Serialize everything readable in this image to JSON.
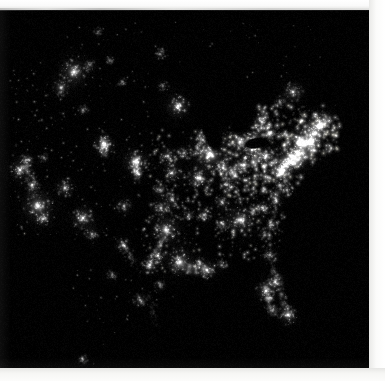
{
  "image": {
    "title": "Continental United States at Night",
    "subject": "city-lights-satellite-composite",
    "alt_text": "Satellite nighttime view of the continental United States showing city lights against black land and ocean",
    "frame": {
      "canvas_width": 385,
      "canvas_height": 381,
      "dark_area_x": 0,
      "dark_area_y": 10,
      "dark_area_width": 369,
      "dark_area_height": 358,
      "border_color": "#f7f7f5",
      "background_color": "#000000",
      "light_color": "#ffffff"
    }
  },
  "chart_data": {
    "type": "heatmap",
    "xlabel": "",
    "ylabel": "",
    "colormap": "black-to-white luminance",
    "grid": false,
    "legend": "none",
    "xlim": [
      0,
      369
    ],
    "ylim": [
      0,
      358
    ],
    "dark_voids": [
      {
        "name": "Lake Michigan",
        "x": 212,
        "y": 124,
        "rx": 9,
        "ry": 20,
        "angle": -18
      },
      {
        "name": "Lake Superior",
        "x": 208,
        "y": 100,
        "rx": 20,
        "ry": 8,
        "angle": -8
      },
      {
        "name": "Lake Huron",
        "x": 240,
        "y": 112,
        "rx": 10,
        "ry": 14,
        "angle": 12
      },
      {
        "name": "Lake Erie",
        "x": 256,
        "y": 133,
        "rx": 14,
        "ry": 6,
        "angle": -10
      },
      {
        "name": "Atlantic Ocean",
        "x": 350,
        "y": 250,
        "rx": 70,
        "ry": 110,
        "angle": 0
      },
      {
        "name": "Gulf of Mexico",
        "x": 215,
        "y": 350,
        "rx": 110,
        "ry": 60,
        "angle": 0
      }
    ],
    "metro_lights": [
      {
        "name": "Seattle-Tacoma",
        "x": 74,
        "y": 62,
        "intensity": 0.92,
        "radius": 9
      },
      {
        "name": "Portland",
        "x": 61,
        "y": 78,
        "intensity": 0.6,
        "radius": 6
      },
      {
        "name": "Spokane",
        "x": 90,
        "y": 55,
        "intensity": 0.42,
        "radius": 4
      },
      {
        "name": "Boise",
        "x": 83,
        "y": 100,
        "intensity": 0.4,
        "radius": 4
      },
      {
        "name": "Billings",
        "x": 122,
        "y": 72,
        "intensity": 0.38,
        "radius": 3
      },
      {
        "name": "Great Falls",
        "x": 110,
        "y": 50,
        "intensity": 0.36,
        "radius": 3
      },
      {
        "name": "Salt Lake City",
        "x": 104,
        "y": 135,
        "intensity": 0.85,
        "radius": 7
      },
      {
        "name": "Denver",
        "x": 136,
        "y": 152,
        "intensity": 0.88,
        "radius": 8
      },
      {
        "name": "Colorado Springs",
        "x": 137,
        "y": 163,
        "intensity": 0.5,
        "radius": 4
      },
      {
        "name": "Albuquerque",
        "x": 124,
        "y": 196,
        "intensity": 0.6,
        "radius": 5
      },
      {
        "name": "El Paso",
        "x": 123,
        "y": 235,
        "intensity": 0.58,
        "radius": 5
      },
      {
        "name": "Phoenix",
        "x": 83,
        "y": 208,
        "intensity": 0.82,
        "radius": 8
      },
      {
        "name": "Tucson",
        "x": 92,
        "y": 224,
        "intensity": 0.52,
        "radius": 5
      },
      {
        "name": "Las Vegas",
        "x": 65,
        "y": 178,
        "intensity": 0.7,
        "radius": 6
      },
      {
        "name": "Los Angeles",
        "x": 38,
        "y": 196,
        "intensity": 0.95,
        "radius": 10
      },
      {
        "name": "San Diego",
        "x": 43,
        "y": 209,
        "intensity": 0.62,
        "radius": 5
      },
      {
        "name": "San Francisco Bay",
        "x": 20,
        "y": 160,
        "intensity": 0.8,
        "radius": 7
      },
      {
        "name": "Sacramento",
        "x": 26,
        "y": 150,
        "intensity": 0.55,
        "radius": 5
      },
      {
        "name": "Fresno-Bakersfield",
        "x": 32,
        "y": 175,
        "intensity": 0.48,
        "radius": 5
      },
      {
        "name": "Reno",
        "x": 44,
        "y": 148,
        "intensity": 0.38,
        "radius": 4
      },
      {
        "name": "Minneapolis-St Paul",
        "x": 178,
        "y": 96,
        "intensity": 0.88,
        "radius": 8
      },
      {
        "name": "Fargo",
        "x": 163,
        "y": 76,
        "intensity": 0.4,
        "radius": 4
      },
      {
        "name": "Omaha",
        "x": 168,
        "y": 146,
        "intensity": 0.62,
        "radius": 6
      },
      {
        "name": "Des Moines",
        "x": 184,
        "y": 143,
        "intensity": 0.52,
        "radius": 5
      },
      {
        "name": "Kansas City",
        "x": 172,
        "y": 163,
        "intensity": 0.72,
        "radius": 6
      },
      {
        "name": "Wichita",
        "x": 160,
        "y": 180,
        "intensity": 0.52,
        "radius": 5
      },
      {
        "name": "Oklahoma City",
        "x": 161,
        "y": 198,
        "intensity": 0.62,
        "radius": 6
      },
      {
        "name": "Tulsa",
        "x": 172,
        "y": 190,
        "intensity": 0.55,
        "radius": 5
      },
      {
        "name": "Dallas-Fort Worth",
        "x": 166,
        "y": 220,
        "intensity": 0.93,
        "radius": 9
      },
      {
        "name": "Austin",
        "x": 158,
        "y": 246,
        "intensity": 0.55,
        "radius": 5
      },
      {
        "name": "San Antonio",
        "x": 150,
        "y": 255,
        "intensity": 0.7,
        "radius": 6
      },
      {
        "name": "Houston",
        "x": 180,
        "y": 252,
        "intensity": 0.9,
        "radius": 9
      },
      {
        "name": "New Orleans",
        "x": 207,
        "y": 260,
        "intensity": 0.7,
        "radius": 6
      },
      {
        "name": "Baton Rouge",
        "x": 200,
        "y": 253,
        "intensity": 0.48,
        "radius": 4
      },
      {
        "name": "Memphis",
        "x": 204,
        "y": 205,
        "intensity": 0.62,
        "radius": 5
      },
      {
        "name": "Little Rock",
        "x": 189,
        "y": 205,
        "intensity": 0.45,
        "radius": 4
      },
      {
        "name": "St Louis",
        "x": 198,
        "y": 168,
        "intensity": 0.78,
        "radius": 7
      },
      {
        "name": "Chicago",
        "x": 210,
        "y": 144,
        "intensity": 0.97,
        "radius": 11
      },
      {
        "name": "Milwaukee",
        "x": 203,
        "y": 130,
        "intensity": 0.6,
        "radius": 5
      },
      {
        "name": "Indianapolis",
        "x": 223,
        "y": 158,
        "intensity": 0.7,
        "radius": 6
      },
      {
        "name": "Detroit",
        "x": 240,
        "y": 132,
        "intensity": 0.85,
        "radius": 8
      },
      {
        "name": "Cleveland",
        "x": 252,
        "y": 140,
        "intensity": 0.75,
        "radius": 7
      },
      {
        "name": "Columbus",
        "x": 244,
        "y": 155,
        "intensity": 0.62,
        "radius": 6
      },
      {
        "name": "Cincinnati",
        "x": 235,
        "y": 166,
        "intensity": 0.62,
        "radius": 6
      },
      {
        "name": "Louisville",
        "x": 227,
        "y": 175,
        "intensity": 0.55,
        "radius": 5
      },
      {
        "name": "Nashville",
        "x": 222,
        "y": 192,
        "intensity": 0.62,
        "radius": 5
      },
      {
        "name": "Birmingham",
        "x": 223,
        "y": 214,
        "intensity": 0.55,
        "radius": 5
      },
      {
        "name": "Atlanta",
        "x": 241,
        "y": 210,
        "intensity": 0.88,
        "radius": 9
      },
      {
        "name": "Pittsburgh",
        "x": 266,
        "y": 146,
        "intensity": 0.72,
        "radius": 6
      },
      {
        "name": "Buffalo",
        "x": 271,
        "y": 122,
        "intensity": 0.52,
        "radius": 5
      },
      {
        "name": "Toronto",
        "x": 262,
        "y": 112,
        "intensity": 0.68,
        "radius": 6
      },
      {
        "name": "Montreal",
        "x": 293,
        "y": 82,
        "intensity": 0.72,
        "radius": 7
      },
      {
        "name": "Ottawa",
        "x": 280,
        "y": 92,
        "intensity": 0.45,
        "radius": 4
      },
      {
        "name": "Boston",
        "x": 321,
        "y": 114,
        "intensity": 0.88,
        "radius": 8
      },
      {
        "name": "Hartford-Providence",
        "x": 313,
        "y": 124,
        "intensity": 0.62,
        "radius": 5
      },
      {
        "name": "New York City",
        "x": 304,
        "y": 134,
        "intensity": 1.0,
        "radius": 12
      },
      {
        "name": "Philadelphia",
        "x": 293,
        "y": 147,
        "intensity": 0.9,
        "radius": 9
      },
      {
        "name": "Baltimore",
        "x": 285,
        "y": 155,
        "intensity": 0.72,
        "radius": 6
      },
      {
        "name": "Washington DC",
        "x": 281,
        "y": 160,
        "intensity": 0.82,
        "radius": 7
      },
      {
        "name": "Richmond",
        "x": 280,
        "y": 175,
        "intensity": 0.55,
        "radius": 5
      },
      {
        "name": "Norfolk",
        "x": 287,
        "y": 180,
        "intensity": 0.55,
        "radius": 5
      },
      {
        "name": "Raleigh",
        "x": 276,
        "y": 190,
        "intensity": 0.52,
        "radius": 5
      },
      {
        "name": "Charlotte",
        "x": 263,
        "y": 198,
        "intensity": 0.58,
        "radius": 5
      },
      {
        "name": "Greenville-Spartanburg",
        "x": 254,
        "y": 200,
        "intensity": 0.45,
        "radius": 4
      },
      {
        "name": "Charleston SC",
        "x": 272,
        "y": 215,
        "intensity": 0.45,
        "radius": 4
      },
      {
        "name": "Savannah",
        "x": 265,
        "y": 225,
        "intensity": 0.42,
        "radius": 4
      },
      {
        "name": "Jacksonville",
        "x": 270,
        "y": 245,
        "intensity": 0.55,
        "radius": 5
      },
      {
        "name": "Orlando",
        "x": 275,
        "y": 272,
        "intensity": 0.7,
        "radius": 6
      },
      {
        "name": "Tampa-St Petersburg",
        "x": 266,
        "y": 281,
        "intensity": 0.78,
        "radius": 7
      },
      {
        "name": "Fort Myers",
        "x": 273,
        "y": 300,
        "intensity": 0.45,
        "radius": 4
      },
      {
        "name": "Miami-Fort Lauderdale",
        "x": 288,
        "y": 305,
        "intensity": 0.82,
        "radius": 7
      },
      {
        "name": "Corpus Christi",
        "x": 160,
        "y": 275,
        "intensity": 0.42,
        "radius": 4
      },
      {
        "name": "Mobile-Pensacola",
        "x": 222,
        "y": 255,
        "intensity": 0.45,
        "radius": 4
      },
      {
        "name": "Monterrey",
        "x": 140,
        "y": 290,
        "intensity": 0.5,
        "radius": 5
      },
      {
        "name": "Tampico",
        "x": 152,
        "y": 330,
        "intensity": 0.42,
        "radius": 4
      },
      {
        "name": "Chihuahua",
        "x": 112,
        "y": 265,
        "intensity": 0.4,
        "radius": 4
      },
      {
        "name": "Guadalajara",
        "x": 83,
        "y": 350,
        "intensity": 0.42,
        "radius": 4
      },
      {
        "name": "Winnipeg",
        "x": 160,
        "y": 44,
        "intensity": 0.45,
        "radius": 4
      },
      {
        "name": "Edmonton-Calgary",
        "x": 98,
        "y": 22,
        "intensity": 0.35,
        "radius": 3
      }
    ],
    "corridors": [
      {
        "name": "Northeast Megalopolis",
        "from": [
          325,
          110
        ],
        "to": [
          278,
          163
        ],
        "width": 9,
        "intensity": 0.85
      },
      {
        "name": "Ohio Valley",
        "from": [
          268,
          145
        ],
        "to": [
          225,
          165
        ],
        "width": 6,
        "intensity": 0.55
      },
      {
        "name": "Lake Erie Shore",
        "from": [
          272,
          124
        ],
        "to": [
          240,
          134
        ],
        "width": 5,
        "intensity": 0.55
      },
      {
        "name": "Gulf Coast Texas-Louisiana",
        "from": [
          178,
          256
        ],
        "to": [
          212,
          262
        ],
        "width": 5,
        "intensity": 0.6
      },
      {
        "name": "Florida East Coast",
        "from": [
          272,
          252
        ],
        "to": [
          290,
          308
        ],
        "width": 4,
        "intensity": 0.6
      },
      {
        "name": "Florida Gulf Coast",
        "from": [
          265,
          276
        ],
        "to": [
          274,
          306
        ],
        "width": 4,
        "intensity": 0.5
      },
      {
        "name": "Atlantic Seaboard South",
        "from": [
          280,
          178
        ],
        "to": [
          268,
          232
        ],
        "width": 4,
        "intensity": 0.4
      },
      {
        "name": "I-35 Texas Corridor",
        "from": [
          166,
          222
        ],
        "to": [
          150,
          258
        ],
        "width": 4,
        "intensity": 0.45
      },
      {
        "name": "California Central Valley",
        "from": [
          26,
          150
        ],
        "to": [
          36,
          186
        ],
        "width": 4,
        "intensity": 0.42
      },
      {
        "name": "Wasatch Front",
        "from": [
          104,
          128
        ],
        "to": [
          104,
          146
        ],
        "width": 4,
        "intensity": 0.55
      },
      {
        "name": "Front Range Colorado",
        "from": [
          136,
          146
        ],
        "to": [
          137,
          168
        ],
        "width": 4,
        "intensity": 0.55
      },
      {
        "name": "Rio Grande Valley",
        "from": [
          123,
          234
        ],
        "to": [
          135,
          255
        ],
        "width": 3,
        "intensity": 0.35
      },
      {
        "name": "Mexico Gulf Coast",
        "from": [
          150,
          282
        ],
        "to": [
          158,
          335
        ],
        "width": 3,
        "intensity": 0.3
      }
    ],
    "region_densities": [
      {
        "name": "Northeast",
        "x0": 255,
        "y0": 95,
        "x1": 340,
        "y1": 185,
        "density": 1.0
      },
      {
        "name": "Great Lakes / Midwest East",
        "x0": 195,
        "y0": 115,
        "x1": 270,
        "y1": 185,
        "density": 0.82
      },
      {
        "name": "Southeast",
        "x0": 215,
        "y0": 185,
        "x1": 290,
        "y1": 250,
        "density": 0.62
      },
      {
        "name": "Midwest Plains",
        "x0": 150,
        "y0": 120,
        "x1": 215,
        "y1": 210,
        "density": 0.5
      },
      {
        "name": "Texas",
        "x0": 140,
        "y0": 205,
        "x1": 200,
        "y1": 265,
        "density": 0.48
      },
      {
        "name": "Mountain West",
        "x0": 70,
        "y0": 60,
        "x1": 150,
        "y1": 240,
        "density": 0.14
      },
      {
        "name": "Pacific Coast",
        "x0": 10,
        "y0": 50,
        "x1": 70,
        "y1": 225,
        "density": 0.22
      },
      {
        "name": "Canada North",
        "x0": 60,
        "y0": 12,
        "x1": 330,
        "y1": 70,
        "density": 0.08
      },
      {
        "name": "Mexico",
        "x0": 70,
        "y0": 255,
        "x1": 175,
        "y1": 356,
        "density": 0.1
      }
    ]
  }
}
